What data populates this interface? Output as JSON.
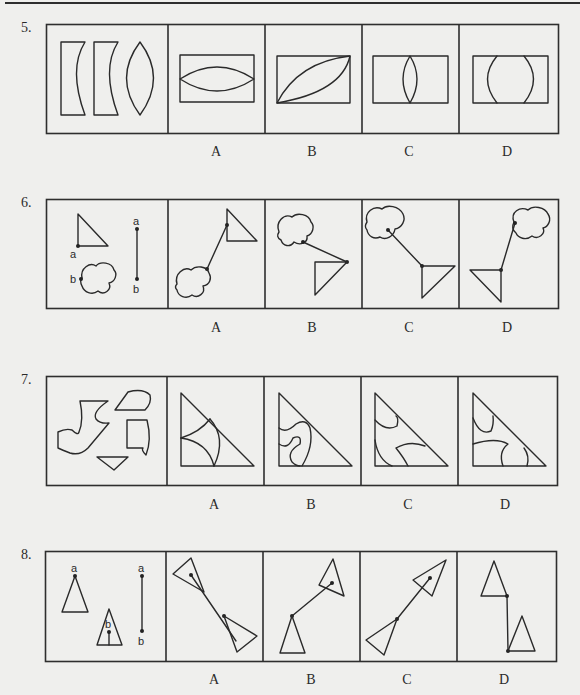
{
  "page": {
    "type": "figure-reasoning exam page",
    "background_color": "#efefed",
    "line_color": "#2e2e2e"
  },
  "questions": [
    {
      "number": "5.",
      "prompt_panel": {
        "description": "Three pieces: a rectangle with concave right side, a second rectangle with concave right side, and a lens (vesica) shape"
      },
      "options": [
        {
          "label": "A",
          "description": "Rectangle containing a horizontal lens shape touching left and right sides"
        },
        {
          "label": "B",
          "description": "Rectangle containing a diagonal lens from bottom-left to top-right corner"
        },
        {
          "label": "C",
          "description": "Rectangle containing a narrow vertical lens touching top and bottom edges"
        },
        {
          "label": "D",
          "description": "Rectangle containing two outward arcs forming a circle clipped by top and bottom edges"
        }
      ]
    },
    {
      "number": "6.",
      "prompt_panel": {
        "description": "Right triangle with point a at right-angle corner, cloud shape with point b on left side, and segment a–b",
        "point_labels": [
          "a",
          "b",
          "a",
          "b"
        ]
      },
      "options": [
        {
          "label": "A",
          "description": "Triangle at top-right, connected by segment to cloud at bottom-left"
        },
        {
          "label": "B",
          "description": "Cloud at top-left connected by segment to inverted triangle at right"
        },
        {
          "label": "C",
          "description": "Cloud at top-left connected by segment to inverted triangle at bottom-center"
        },
        {
          "label": "D",
          "description": "Inverted triangle at bottom-left connected by segment to cloud at top-right"
        }
      ]
    },
    {
      "number": "7.",
      "prompt_panel": {
        "description": "Four irregular pieces: a J/boot-shaped piece, a leaf-like quadrilateral, a curved rectangle piece, and a small triangular wedge"
      },
      "options": [
        {
          "label": "A",
          "description": "Right triangle divided by two concave arcs"
        },
        {
          "label": "B",
          "description": "Right triangle with wavy S-shaped internal curve"
        },
        {
          "label": "C",
          "description": "Right triangle with arcs near top-left and a curved wedge near bottom"
        },
        {
          "label": "D",
          "description": "Right triangle with arc at top, curved band across middle and vertical arc near bottom right"
        }
      ]
    },
    {
      "number": "8.",
      "prompt_panel": {
        "description": "Isosceles triangle with point a at apex, smaller triangle with point b inside on a vertical stem, and segment a–b",
        "point_labels": [
          "a",
          "b",
          "a",
          "b"
        ]
      },
      "options": [
        {
          "label": "A",
          "description": "Two triangles joined along a diagonal line, one at top-left, one at bottom-right"
        },
        {
          "label": "B",
          "description": "Upright triangle at bottom-left joined by segment to tilted triangle at upper right"
        },
        {
          "label": "C",
          "description": "Tilted triangle at bottom-left joined by segment to tilted triangle at upper right"
        },
        {
          "label": "D",
          "description": "Triangle at top-left joined by vertical segment to triangle at bottom-right"
        }
      ]
    }
  ]
}
